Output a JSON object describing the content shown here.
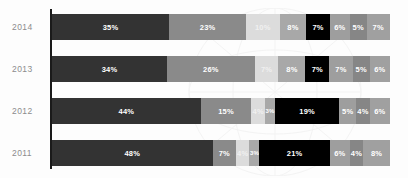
{
  "chart_data": {
    "type": "bar",
    "orientation": "horizontal",
    "stacked": true,
    "normalized_percent": true,
    "title": "",
    "subtitle": "",
    "xlabel": "",
    "ylabel": "",
    "xlim": [
      0,
      100
    ],
    "grid": false,
    "legend": "none",
    "categories": [
      "2014",
      "2013",
      "2012",
      "2011"
    ],
    "series": [
      {
        "name": "Segment 1",
        "color": "#333333",
        "text_color": "#ffffff",
        "values": [
          35,
          34,
          44,
          48
        ]
      },
      {
        "name": "Segment 2",
        "color": "#8a8a8a",
        "text_color": "#ffffff",
        "values": [
          23,
          26,
          15,
          7
        ]
      },
      {
        "name": "Segment 3",
        "color": "#dcdcdc",
        "text_color": "#f2f2f2",
        "values": [
          10,
          7,
          4,
          4
        ]
      },
      {
        "name": "Segment 4",
        "color": "#a8a8a8",
        "text_color": "#ffffff",
        "values": [
          8,
          8,
          3,
          3
        ]
      },
      {
        "name": "Segment 5",
        "color": "#000000",
        "text_color": "#ffffff",
        "values": [
          7,
          7,
          19,
          21
        ]
      },
      {
        "name": "Segment 6",
        "color": "#9e9e9e",
        "text_color": "#ffffff",
        "values": [
          6,
          7,
          5,
          6
        ]
      },
      {
        "name": "Segment 7",
        "color": "#868686",
        "text_color": "#ffffff",
        "values": [
          5,
          5,
          4,
          4
        ]
      },
      {
        "name": "Segment 8",
        "color": "#a0a0a0",
        "text_color": "#ffffff",
        "values": [
          7,
          6,
          6,
          8
        ]
      }
    ],
    "rows": [
      {
        "category": "2014",
        "segments": [
          {
            "label": "35%",
            "value": 35,
            "color": "#333333",
            "text_color": "#ffffff"
          },
          {
            "label": "23%",
            "value": 23,
            "color": "#8a8a8a",
            "text_color": "#ffffff"
          },
          {
            "label": "10%",
            "value": 10,
            "color": "#dcdcdc",
            "text_color": "#f0f0f0"
          },
          {
            "label": "8%",
            "value": 8,
            "color": "#a8a8a8",
            "text_color": "#ffffff"
          },
          {
            "label": "7%",
            "value": 7,
            "color": "#000000",
            "text_color": "#ffffff"
          },
          {
            "label": "6%",
            "value": 6,
            "color": "#9e9e9e",
            "text_color": "#ffffff"
          },
          {
            "label": "5%",
            "value": 5,
            "color": "#868686",
            "text_color": "#ffffff"
          },
          {
            "label": "7%",
            "value": 7,
            "color": "#a0a0a0",
            "text_color": "#ffffff"
          }
        ]
      },
      {
        "category": "2013",
        "segments": [
          {
            "label": "34%",
            "value": 34,
            "color": "#333333",
            "text_color": "#ffffff"
          },
          {
            "label": "26%",
            "value": 26,
            "color": "#8a8a8a",
            "text_color": "#ffffff"
          },
          {
            "label": "7%",
            "value": 7,
            "color": "#dcdcdc",
            "text_color": "#f0f0f0"
          },
          {
            "label": "8%",
            "value": 8,
            "color": "#a8a8a8",
            "text_color": "#ffffff"
          },
          {
            "label": "7%",
            "value": 7,
            "color": "#000000",
            "text_color": "#ffffff"
          },
          {
            "label": "7%",
            "value": 7,
            "color": "#9e9e9e",
            "text_color": "#ffffff"
          },
          {
            "label": "5%",
            "value": 5,
            "color": "#868686",
            "text_color": "#ffffff"
          },
          {
            "label": "6%",
            "value": 6,
            "color": "#a0a0a0",
            "text_color": "#ffffff"
          }
        ]
      },
      {
        "category": "2012",
        "segments": [
          {
            "label": "44%",
            "value": 44,
            "color": "#333333",
            "text_color": "#ffffff"
          },
          {
            "label": "15%",
            "value": 15,
            "color": "#8a8a8a",
            "text_color": "#ffffff"
          },
          {
            "label": "4%",
            "value": 4,
            "color": "#dcdcdc",
            "text_color": "#f0f0f0"
          },
          {
            "label": "3%",
            "value": 3,
            "color": "#a8a8a8",
            "text_color": "#ffffff"
          },
          {
            "label": "19%",
            "value": 19,
            "color": "#000000",
            "text_color": "#ffffff"
          },
          {
            "label": "5%",
            "value": 5,
            "color": "#9e9e9e",
            "text_color": "#ffffff"
          },
          {
            "label": "4%",
            "value": 4,
            "color": "#868686",
            "text_color": "#ffffff"
          },
          {
            "label": "6%",
            "value": 6,
            "color": "#a0a0a0",
            "text_color": "#ffffff"
          }
        ]
      },
      {
        "category": "2011",
        "segments": [
          {
            "label": "48%",
            "value": 48,
            "color": "#333333",
            "text_color": "#ffffff"
          },
          {
            "label": "7%",
            "value": 7,
            "color": "#8a8a8a",
            "text_color": "#ffffff"
          },
          {
            "label": "4%",
            "value": 4,
            "color": "#dcdcdc",
            "text_color": "#f0f0f0"
          },
          {
            "label": "3%",
            "value": 3,
            "color": "#a8a8a8",
            "text_color": "#ffffff"
          },
          {
            "label": "21%",
            "value": 21,
            "color": "#000000",
            "text_color": "#ffffff"
          },
          {
            "label": "6%",
            "value": 6,
            "color": "#9e9e9e",
            "text_color": "#ffffff"
          },
          {
            "label": "4%",
            "value": 4,
            "color": "#868686",
            "text_color": "#ffffff"
          },
          {
            "label": "8%",
            "value": 8,
            "color": "#a0a0a0",
            "text_color": "#ffffff"
          }
        ]
      }
    ]
  },
  "layout": {
    "row_tops": [
      14,
      56,
      98,
      140
    ],
    "axis_color": "#1a1a1a",
    "background": "#fdfdfd",
    "label_color": "#8c8c8c",
    "min_label_width_pct": 3.2
  }
}
